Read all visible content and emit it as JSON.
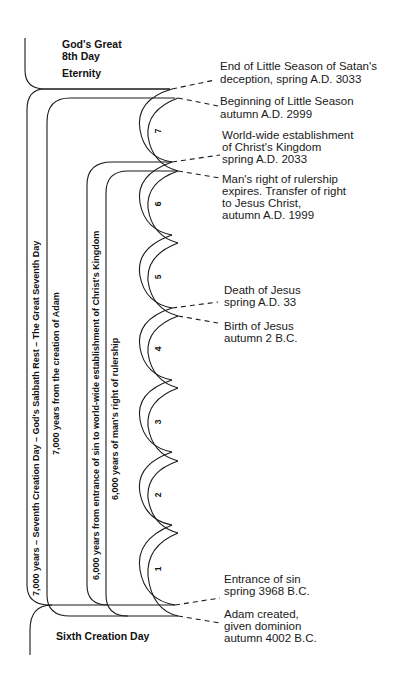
{
  "top_section": {
    "title_line1": "God's Great",
    "title_line2": "8th Day",
    "subtitle": "Eternity"
  },
  "bottom_section": {
    "title": "Sixth Creation Day"
  },
  "brackets": [
    {
      "label": "7,000 years – Seventh Creation Day – God's Sabbath Rest – The Great Seventh Day"
    },
    {
      "label": "7,000 years from the creation of Adam"
    },
    {
      "label": "6,000 years from entrance of sin to world-wide establishment of Christ's Kingdom"
    },
    {
      "label": "6,000 years of man's right of rulership"
    }
  ],
  "millennia": [
    "1",
    "2",
    "3",
    "4",
    "5",
    "6",
    "7"
  ],
  "events": [
    {
      "line1": "End of Little Season of Satan's",
      "line2": "deception, spring A.D. 3033"
    },
    {
      "line1": "Beginning of Little Season",
      "line2": "autumn A.D. 2999"
    },
    {
      "line1": "World-wide establishment",
      "line2": "of Christ's Kingdom",
      "line3": "spring A.D. 2033"
    },
    {
      "line1": "Man's right of rulership",
      "line2": "expires. Transfer of right",
      "line3": "to Jesus Christ,",
      "line4": "autumn A.D. 1999"
    },
    {
      "line1": "Death of Jesus",
      "line2": "spring A.D. 33"
    },
    {
      "line1": "Birth of Jesus",
      "line2": "autumn 2 B.C."
    },
    {
      "line1": "Entrance of sin",
      "line2": "spring 3968 B.C."
    },
    {
      "line1": "Adam created,",
      "line2": "given dominion",
      "line3": "autumn 4002 B.C."
    }
  ],
  "colors": {
    "line": "#1a1a1a",
    "background": "#ffffff"
  }
}
